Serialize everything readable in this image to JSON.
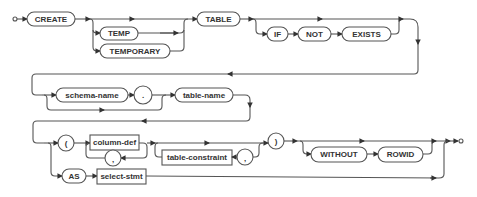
{
  "diagram": {
    "type": "railroad-syntax-diagram",
    "colors": {
      "line": "#555555",
      "text": "#333333",
      "background": "#ffffff"
    },
    "row1": {
      "create": "CREATE",
      "temp": "TEMP",
      "temporary": "TEMPORARY",
      "table": "TABLE",
      "if": "IF",
      "not": "NOT",
      "exists": "EXISTS"
    },
    "row2": {
      "schema_name": "schema-name",
      "dot": ".",
      "table_name": "table-name"
    },
    "row3": {
      "lparen": "(",
      "column_def": "column-def",
      "comma1": ",",
      "table_constraint": "table-constraint",
      "comma2": ",",
      "rparen": ")",
      "without": "WITHOUT",
      "rowid": "ROWID",
      "as": "AS",
      "select_stmt": "select-stmt"
    }
  }
}
